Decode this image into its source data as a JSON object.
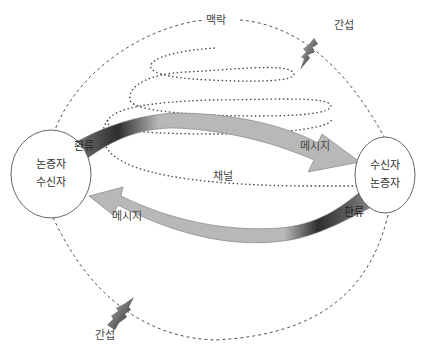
{
  "diagram": {
    "type": "communication-model",
    "context_label": "맥락",
    "channel_label": "채널",
    "interference": [
      {
        "label": "간섭",
        "position": "top-right"
      },
      {
        "label": "간섭",
        "position": "bottom-left"
      }
    ],
    "nodes": [
      {
        "id": "left",
        "lines": [
          "논증자",
          "수신자"
        ]
      },
      {
        "id": "right",
        "lines": [
          "수신자",
          "논증자"
        ]
      }
    ],
    "arrows": [
      {
        "from": "left",
        "to": "right",
        "feedback_label": "환류",
        "message_label": "메시지"
      },
      {
        "from": "right",
        "to": "left",
        "feedback_label": "환류",
        "message_label": "메시지"
      }
    ],
    "colors": {
      "arrow_light": "#b5b5b5",
      "arrow_dark": "#2a2a2a",
      "outline": "#666666",
      "dotted": "#444444"
    }
  }
}
